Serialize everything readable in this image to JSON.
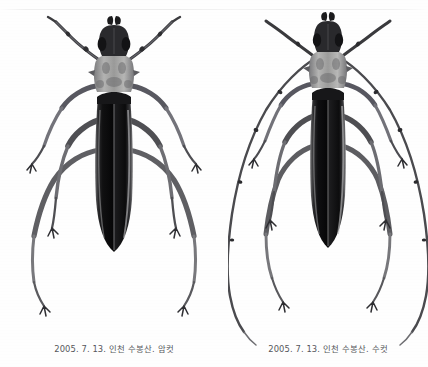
{
  "page": {
    "background_color": "#fefefe",
    "rule_color": "#e9e9ec",
    "ink_color": "#1a1a1a",
    "caption_color": "#56585c"
  },
  "figures": [
    {
      "id": "female",
      "specimen": "longhorn-beetle-female",
      "caption": "2005. 7. 13. 인천 수봉산. 암컷",
      "date": "2005. 7. 13.",
      "locality": "인천 수봉산",
      "sex_label": "암컷"
    },
    {
      "id": "male",
      "specimen": "longhorn-beetle-male",
      "caption": "2005. 7. 13. 인천 수봉산. 수컷",
      "date": "2005. 7. 13.",
      "locality": "인천 수봉산",
      "sex_label": "수컷"
    }
  ]
}
